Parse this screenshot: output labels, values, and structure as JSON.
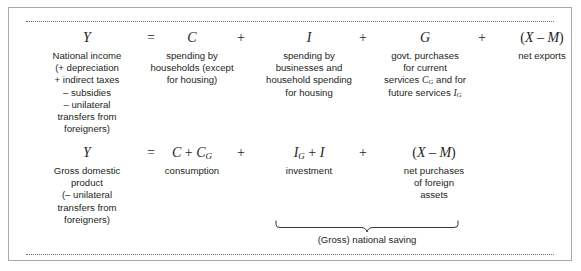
{
  "figure": {
    "border_color": "#a7a9ac",
    "rule_color": "#6d6e71",
    "text_color": "#231f20"
  },
  "rows": [
    {
      "id": "row-1",
      "terms": [
        {
          "symbol": "Y",
          "description": "National income\n(+ depreciation\n+ indirect taxes\n– subsidies\n– unilateral\ntransfers from\nforeigners)"
        },
        {
          "symbol": "C",
          "description": "spending by\nhouseholds (except\nfor housing)"
        },
        {
          "symbol": "I",
          "description": "spending by\nbusinesses and\nhousehold spending\nfor housing"
        },
        {
          "symbol": "G",
          "description_line_1": "govt. purchases",
          "description_line_2": "for current",
          "description_line_3_a": "services ",
          "description_line_3_b": "C",
          "description_line_3_sub": "G",
          "description_line_3_c": " and for",
          "description_line_4_a": "future services ",
          "description_line_4_b": "I",
          "description_line_4_sub": "G"
        },
        {
          "symbol_open": "(",
          "symbol_x": "X",
          "symbol_minus": " – ",
          "symbol_m": "M",
          "symbol_close": ")",
          "description": "net exports"
        }
      ],
      "operators": {
        "equals": "=",
        "plus_1": "+",
        "plus_2": "+",
        "plus_3": "+"
      }
    },
    {
      "id": "row-2",
      "terms": [
        {
          "symbol": "Y",
          "description": "Gross domestic\nproduct\n(– unilateral\ntransfers from\nforeigners)"
        },
        {
          "symbol_c": "C",
          "symbol_plus": " + ",
          "symbol_cg": "C",
          "symbol_cg_sub": "G",
          "description": "consumption"
        },
        {
          "symbol_ig": "I",
          "symbol_ig_sub": "G",
          "symbol_plus": " + ",
          "symbol_i": "I",
          "description": "investment"
        },
        {
          "symbol_open": "(",
          "symbol_x": "X",
          "symbol_minus": " – ",
          "symbol_m": "M",
          "symbol_close": ")",
          "description": "net purchases\nof foreign\nassets"
        }
      ],
      "operators": {
        "equals": "=",
        "plus_1": "+",
        "plus_2": "+"
      }
    }
  ],
  "brace": {
    "label": "(Gross) national saving"
  }
}
